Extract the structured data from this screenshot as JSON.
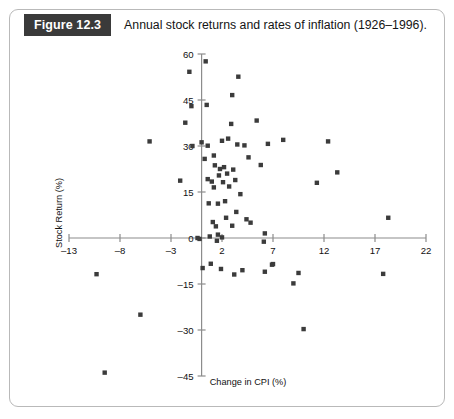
{
  "figure": {
    "badge_label": "Figure 12.3",
    "caption": "Annual stock returns and rates of inflation (1926–1996).",
    "badge_bg": "#3a3a3a",
    "badge_fg": "#ffffff",
    "frame_color": "#b9b9b9"
  },
  "chart_data": {
    "type": "scatter",
    "title": "Annual stock returns and rates of inflation (1926–1996).",
    "xlabel": "Change in CPI (%)",
    "ylabel": "Stock Return (%)",
    "xlim": [
      -13,
      22
    ],
    "ylim": [
      -45,
      60
    ],
    "xticks": [
      -13,
      -8,
      -3,
      2,
      7,
      12,
      17,
      22
    ],
    "yticks": [
      -45,
      -30,
      -15,
      0,
      15,
      30,
      45,
      60
    ],
    "xticklabels": [
      "–13",
      "–8",
      "–3",
      "2",
      "7",
      "12",
      "17",
      "22"
    ],
    "yticklabels": [
      "–45",
      "–30",
      "–15",
      "0",
      "15",
      "30",
      "45",
      "60"
    ],
    "grid": false,
    "legend": null,
    "marker": "square",
    "marker_color": "#3b3b3b",
    "n_points": 71,
    "series": [
      {
        "name": "Annual stock return vs. change in CPI",
        "points": [
          [
            -10.3,
            -11.8
          ],
          [
            -9.5,
            -43.9
          ],
          [
            -6.0,
            -25.0
          ],
          [
            -5.1,
            31.5
          ],
          [
            -2.1,
            18.7
          ],
          [
            -1.6,
            37.6
          ],
          [
            -1.2,
            54.2
          ],
          [
            -1.0,
            43.0
          ],
          [
            -0.9,
            30.0
          ],
          [
            -0.4,
            0.0
          ],
          [
            -0.2,
            -0.3
          ],
          [
            0.0,
            31.2
          ],
          [
            0.1,
            -9.8
          ],
          [
            0.3,
            25.8
          ],
          [
            0.4,
            57.6
          ],
          [
            0.5,
            43.4
          ],
          [
            0.6,
            30.1
          ],
          [
            0.6,
            19.2
          ],
          [
            0.7,
            11.3
          ],
          [
            0.8,
            0.5
          ],
          [
            0.9,
            -8.4
          ],
          [
            1.0,
            18.4
          ],
          [
            1.1,
            5.2
          ],
          [
            1.2,
            26.9
          ],
          [
            1.2,
            16.5
          ],
          [
            1.3,
            23.7
          ],
          [
            1.4,
            3.8
          ],
          [
            1.5,
            -0.9
          ],
          [
            1.6,
            1.1
          ],
          [
            1.6,
            11.2
          ],
          [
            1.7,
            20.4
          ],
          [
            1.8,
            22.5
          ],
          [
            1.9,
            -10.1
          ],
          [
            2.0,
            0.2
          ],
          [
            2.0,
            31.7
          ],
          [
            2.1,
            18.2
          ],
          [
            2.2,
            23.1
          ],
          [
            2.3,
            12.0
          ],
          [
            2.4,
            6.6
          ],
          [
            2.5,
            21.0
          ],
          [
            2.6,
            32.4
          ],
          [
            2.7,
            16.8
          ],
          [
            2.9,
            37.2
          ],
          [
            3.0,
            4.0
          ],
          [
            3.0,
            46.6
          ],
          [
            3.1,
            22.3
          ],
          [
            3.2,
            -11.9
          ],
          [
            3.3,
            18.9
          ],
          [
            3.4,
            8.5
          ],
          [
            3.5,
            30.5
          ],
          [
            3.6,
            52.6
          ],
          [
            3.8,
            14.3
          ],
          [
            4.0,
            -10.5
          ],
          [
            4.2,
            30.2
          ],
          [
            4.4,
            6.1
          ],
          [
            4.6,
            26.3
          ],
          [
            4.8,
            5.0
          ],
          [
            5.4,
            38.3
          ],
          [
            5.8,
            23.8
          ],
          [
            6.1,
            -1.2
          ],
          [
            6.2,
            1.5
          ],
          [
            6.2,
            -11.0
          ],
          [
            6.5,
            30.7
          ],
          [
            6.9,
            -8.7
          ],
          [
            7.0,
            -8.5
          ],
          [
            8.0,
            32.0
          ],
          [
            9.0,
            -14.8
          ],
          [
            9.5,
            -11.4
          ],
          [
            10.0,
            -29.7
          ],
          [
            11.3,
            18.0
          ],
          [
            12.4,
            31.5
          ],
          [
            13.3,
            21.4
          ],
          [
            17.8,
            -11.7
          ],
          [
            18.3,
            6.6
          ]
        ]
      }
    ]
  }
}
